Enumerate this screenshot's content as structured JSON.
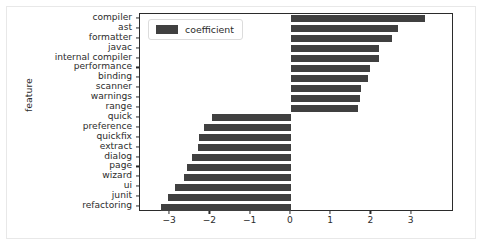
{
  "chart_data": {
    "type": "bar",
    "orientation": "horizontal",
    "title": "",
    "xlabel": "",
    "ylabel": "feature",
    "xlim": [
      -3.75,
      4.05
    ],
    "ylim_categories_top_to_bottom": true,
    "grid": false,
    "bar_color": "#404040",
    "legend": {
      "entries": [
        "coefficient"
      ],
      "position": "upper left"
    },
    "xticks": [
      -3,
      -2,
      -1,
      0,
      1,
      2,
      3
    ],
    "xtick_labels": [
      "−3",
      "−2",
      "−1",
      "0",
      "1",
      "2",
      "3"
    ],
    "categories": [
      "compiler",
      "ast",
      "formatter",
      "javac",
      "internal compiler",
      "performance",
      "binding",
      "scanner",
      "warnings",
      "range",
      "quick",
      "preference",
      "quickfix",
      "extract",
      "dialog",
      "page",
      "wizard",
      "ui",
      "junit",
      "refactoring"
    ],
    "series": [
      {
        "name": "coefficient",
        "values": [
          3.33,
          2.65,
          2.52,
          2.18,
          2.18,
          1.97,
          1.92,
          1.75,
          1.72,
          1.67,
          -1.97,
          -2.15,
          -2.28,
          -2.3,
          -2.45,
          -2.58,
          -2.65,
          -2.88,
          -3.05,
          -3.22
        ]
      }
    ]
  }
}
